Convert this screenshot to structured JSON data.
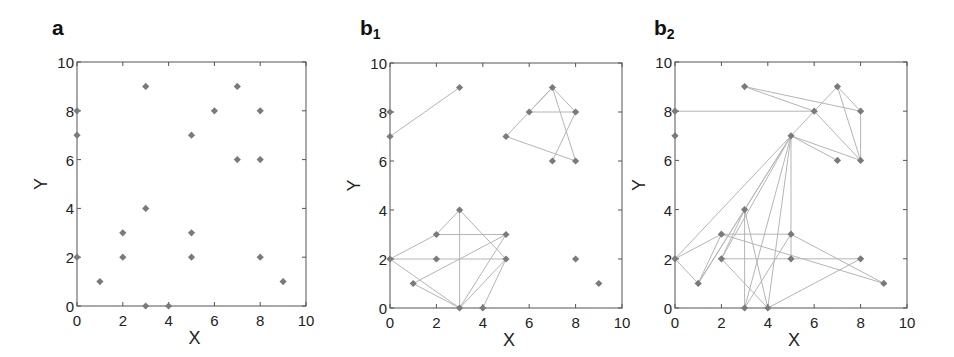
{
  "chart_data": [
    {
      "panel": "a",
      "label_main": "a",
      "label_sub": "",
      "type": "scatter",
      "title": "",
      "xlabel": "X",
      "ylabel": "Y",
      "xlim": [
        0,
        10
      ],
      "ylim": [
        0,
        10
      ],
      "xticks": [
        0,
        2,
        4,
        6,
        8,
        10
      ],
      "yticks": [
        0,
        2,
        4,
        6,
        8,
        10
      ],
      "grid": false,
      "marker": "diamond",
      "marker_color": "#7a7a7a",
      "points": [
        [
          0,
          8
        ],
        [
          0,
          7
        ],
        [
          0,
          2
        ],
        [
          1,
          1
        ],
        [
          2,
          3
        ],
        [
          2,
          2
        ],
        [
          3,
          9
        ],
        [
          3,
          4
        ],
        [
          3,
          0
        ],
        [
          4,
          0
        ],
        [
          5,
          7
        ],
        [
          5,
          3
        ],
        [
          5,
          2
        ],
        [
          6,
          8
        ],
        [
          7,
          9
        ],
        [
          7,
          6
        ],
        [
          8,
          8
        ],
        [
          8,
          6
        ],
        [
          8,
          2
        ],
        [
          9,
          1
        ]
      ],
      "edges": []
    },
    {
      "panel": "b1",
      "label_main": "b",
      "label_sub": "1",
      "type": "scatter",
      "title": "",
      "xlabel": "X",
      "ylabel": "Y",
      "xlim": [
        0,
        10
      ],
      "ylim": [
        0,
        10
      ],
      "xticks": [
        0,
        2,
        4,
        6,
        8,
        10
      ],
      "yticks": [
        0,
        2,
        4,
        6,
        8,
        10
      ],
      "grid": false,
      "marker": "diamond",
      "marker_color": "#7a7a7a",
      "edge_color": "#b5b5b5",
      "points": [
        [
          0,
          8
        ],
        [
          0,
          7
        ],
        [
          0,
          2
        ],
        [
          1,
          1
        ],
        [
          2,
          3
        ],
        [
          2,
          2
        ],
        [
          3,
          9
        ],
        [
          3,
          4
        ],
        [
          3,
          0
        ],
        [
          4,
          0
        ],
        [
          5,
          7
        ],
        [
          5,
          3
        ],
        [
          5,
          2
        ],
        [
          6,
          8
        ],
        [
          7,
          9
        ],
        [
          7,
          6
        ],
        [
          8,
          8
        ],
        [
          8,
          6
        ],
        [
          8,
          2
        ],
        [
          9,
          1
        ]
      ],
      "edges": [
        [
          [
            0,
            7
          ],
          [
            3,
            9
          ]
        ],
        [
          [
            0,
            2
          ],
          [
            2,
            3
          ]
        ],
        [
          [
            2,
            3
          ],
          [
            3,
            4
          ]
        ],
        [
          [
            2,
            3
          ],
          [
            5,
            3
          ]
        ],
        [
          [
            0,
            2
          ],
          [
            2,
            2
          ]
        ],
        [
          [
            2,
            2
          ],
          [
            5,
            2
          ]
        ],
        [
          [
            3,
            4
          ],
          [
            3,
            0
          ]
        ],
        [
          [
            3,
            4
          ],
          [
            5,
            2
          ]
        ],
        [
          [
            1,
            1
          ],
          [
            5,
            3
          ]
        ],
        [
          [
            0,
            2
          ],
          [
            3,
            0
          ]
        ],
        [
          [
            1,
            1
          ],
          [
            3,
            0
          ]
        ],
        [
          [
            3,
            0
          ],
          [
            5,
            3
          ]
        ],
        [
          [
            3,
            0
          ],
          [
            5,
            2
          ]
        ],
        [
          [
            4,
            0
          ],
          [
            5,
            2
          ]
        ],
        [
          [
            5,
            7
          ],
          [
            7,
            9
          ]
        ],
        [
          [
            6,
            8
          ],
          [
            7,
            9
          ]
        ],
        [
          [
            6,
            8
          ],
          [
            8,
            8
          ]
        ],
        [
          [
            7,
            9
          ],
          [
            8,
            8
          ]
        ],
        [
          [
            7,
            9
          ],
          [
            8,
            6
          ]
        ],
        [
          [
            8,
            8
          ],
          [
            7,
            6
          ]
        ],
        [
          [
            5,
            7
          ],
          [
            8,
            6
          ]
        ]
      ]
    },
    {
      "panel": "b2",
      "label_main": "b",
      "label_sub": "2",
      "type": "scatter",
      "title": "",
      "xlabel": "X",
      "ylabel": "Y",
      "xlim": [
        0,
        10
      ],
      "ylim": [
        0,
        10
      ],
      "xticks": [
        0,
        2,
        4,
        6,
        8,
        10
      ],
      "yticks": [
        0,
        2,
        4,
        6,
        8,
        10
      ],
      "grid": false,
      "marker": "diamond",
      "marker_color": "#7a7a7a",
      "edge_color": "#b5b5b5",
      "points": [
        [
          0,
          8
        ],
        [
          0,
          7
        ],
        [
          0,
          2
        ],
        [
          1,
          1
        ],
        [
          2,
          3
        ],
        [
          2,
          2
        ],
        [
          3,
          9
        ],
        [
          3,
          4
        ],
        [
          3,
          0
        ],
        [
          4,
          0
        ],
        [
          5,
          7
        ],
        [
          5,
          3
        ],
        [
          5,
          2
        ],
        [
          6,
          8
        ],
        [
          7,
          9
        ],
        [
          7,
          6
        ],
        [
          8,
          8
        ],
        [
          8,
          6
        ],
        [
          8,
          2
        ],
        [
          9,
          1
        ]
      ],
      "edges": [
        [
          [
            0,
            8
          ],
          [
            6,
            8
          ]
        ],
        [
          [
            3,
            9
          ],
          [
            6,
            8
          ]
        ],
        [
          [
            3,
            9
          ],
          [
            8,
            8
          ]
        ],
        [
          [
            5,
            7
          ],
          [
            7,
            9
          ]
        ],
        [
          [
            6,
            8
          ],
          [
            8,
            6
          ]
        ],
        [
          [
            7,
            9
          ],
          [
            8,
            8
          ]
        ],
        [
          [
            7,
            9
          ],
          [
            8,
            6
          ]
        ],
        [
          [
            8,
            8
          ],
          [
            8,
            6
          ]
        ],
        [
          [
            5,
            7
          ],
          [
            7,
            6
          ]
        ],
        [
          [
            5,
            7
          ],
          [
            8,
            6
          ]
        ],
        [
          [
            5,
            7
          ],
          [
            0,
            2
          ]
        ],
        [
          [
            5,
            7
          ],
          [
            1,
            1
          ]
        ],
        [
          [
            5,
            7
          ],
          [
            2,
            2
          ]
        ],
        [
          [
            5,
            7
          ],
          [
            3,
            4
          ]
        ],
        [
          [
            5,
            7
          ],
          [
            3,
            0
          ]
        ],
        [
          [
            5,
            7
          ],
          [
            4,
            0
          ]
        ],
        [
          [
            5,
            7
          ],
          [
            5,
            3
          ]
        ],
        [
          [
            5,
            3
          ],
          [
            5,
            2
          ]
        ],
        [
          [
            0,
            2
          ],
          [
            2,
            3
          ]
        ],
        [
          [
            0,
            2
          ],
          [
            1,
            1
          ]
        ],
        [
          [
            1,
            1
          ],
          [
            2,
            3
          ]
        ],
        [
          [
            1,
            1
          ],
          [
            3,
            4
          ]
        ],
        [
          [
            2,
            2
          ],
          [
            3,
            4
          ]
        ],
        [
          [
            2,
            3
          ],
          [
            5,
            3
          ]
        ],
        [
          [
            2,
            2
          ],
          [
            5,
            2
          ]
        ],
        [
          [
            5,
            2
          ],
          [
            8,
            2
          ]
        ],
        [
          [
            3,
            4
          ],
          [
            3,
            0
          ]
        ],
        [
          [
            3,
            4
          ],
          [
            4,
            0
          ]
        ],
        [
          [
            2,
            2
          ],
          [
            4,
            0
          ]
        ],
        [
          [
            2,
            3
          ],
          [
            9,
            1
          ]
        ],
        [
          [
            5,
            3
          ],
          [
            9,
            1
          ]
        ],
        [
          [
            3,
            0
          ],
          [
            5,
            3
          ]
        ],
        [
          [
            4,
            0
          ],
          [
            8,
            2
          ]
        ]
      ]
    }
  ],
  "layout": {
    "panels": [
      {
        "left": 77,
        "top": 62,
        "width": 229,
        "height": 244,
        "label_x": 52,
        "label_y": 16
      },
      {
        "left": 390,
        "top": 63,
        "width": 232,
        "height": 245,
        "label_x": 360,
        "label_y": 16
      },
      {
        "left": 675,
        "top": 62,
        "width": 232,
        "height": 246,
        "label_x": 654,
        "label_y": 16
      }
    ]
  }
}
